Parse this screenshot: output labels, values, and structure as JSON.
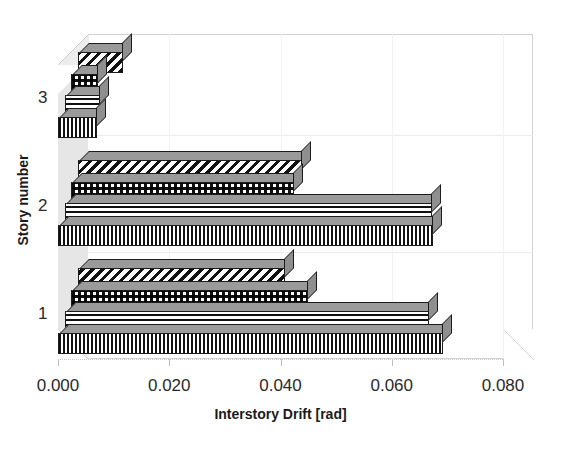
{
  "chart_data": {
    "type": "bar",
    "orientation": "horizontal",
    "style": "3d-clustered-bar",
    "title": "",
    "xlabel": "Interstory Drift [rad]",
    "ylabel": "Story number",
    "categories": [
      "1",
      "2",
      "3"
    ],
    "xlim": [
      0.0,
      0.08
    ],
    "xticks": [
      "0.000",
      "0.020",
      "0.040",
      "0.060",
      "0.080"
    ],
    "xtick_values": [
      0.0,
      0.02,
      0.04,
      0.06,
      0.08
    ],
    "grid": true,
    "legend": "none",
    "series": [
      {
        "name": "Series 1",
        "pattern": "diagonal-stripes",
        "values": [
          0.0372,
          0.0402,
          0.0081
        ]
      },
      {
        "name": "Series 2",
        "pattern": "checkerboard",
        "values": [
          0.0426,
          0.04,
          0.0048
        ]
      },
      {
        "name": "Series 3",
        "pattern": "horizontal-lines",
        "values": [
          0.0654,
          0.066,
          0.0063
        ]
      },
      {
        "name": "Series 4",
        "pattern": "vertical-lines",
        "values": [
          0.0692,
          0.0674,
          0.007
        ]
      }
    ]
  },
  "axis": {
    "x_title": "Interstory Drift [rad]",
    "y_title": "Story number",
    "x_tick_labels": [
      "0.000",
      "0.020",
      "0.040",
      "0.060",
      "0.080"
    ],
    "y_tick_labels": [
      "1",
      "2",
      "3"
    ]
  },
  "colors": {
    "ink": "#1c1c1c",
    "plot_border": "#d2d2d2",
    "wall": "#e6e6e6",
    "gridline": "#ececec",
    "bar_side": "#8f8f8f"
  }
}
